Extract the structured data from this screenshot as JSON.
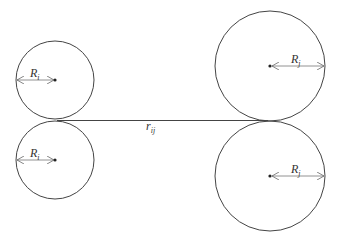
{
  "diagram": {
    "title": "",
    "stroke_color": "#444444",
    "circles": [
      {
        "id": "left-top",
        "cx": 55,
        "cy": 80,
        "r": 39,
        "label": "R",
        "subscript": "i"
      },
      {
        "id": "left-bottom",
        "cx": 55,
        "cy": 160,
        "r": 39,
        "label": "R",
        "subscript": "i"
      },
      {
        "id": "right-top",
        "cx": 270,
        "cy": 66,
        "r": 55,
        "label": "R",
        "subscript": "j"
      },
      {
        "id": "right-bottom",
        "cx": 270,
        "cy": 176,
        "r": 55,
        "label": "R",
        "subscript": "j"
      }
    ],
    "connector": {
      "label": "r",
      "subscript": "ij",
      "x1": 57,
      "y1": 120,
      "x2": 268,
      "y2": 120
    }
  }
}
